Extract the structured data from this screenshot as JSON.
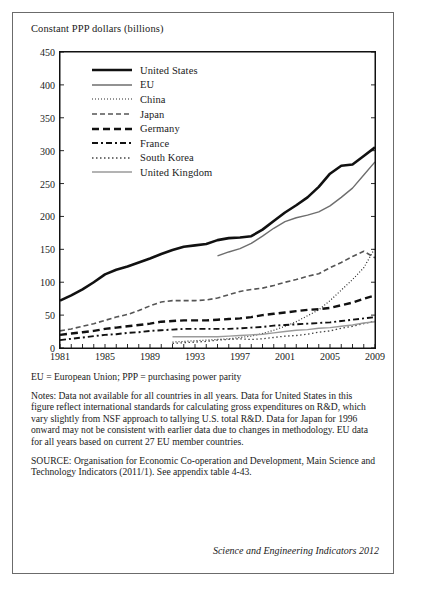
{
  "figure": {
    "axis_title": "Constant PPP dollars (billions)",
    "abbrev_note": "EU = European Union;  PPP = purchasing power parity",
    "notes": "Notes: Data not available for all countries in all years. Data for United States in this figure reflect international standards for calculating gross expenditures on R&D, which vary slightly from NSF approach to tallying U.S. total R&D. Data for Japan for 1996 onward may not be consistent with earlier data due to changes in methodology. EU data for all years based on current 27 EU member countries.",
    "source": "SOURCE: Organisation for Economic Co-operation and Development, Main Science and Technology Indicators (2011/1). See appendix table 4-43.",
    "credit": "Science and Engineering Indicators 2012"
  },
  "chart_data": {
    "type": "line",
    "title": "",
    "xlabel": "",
    "ylabel": "Constant PPP dollars (billions)",
    "xlim": [
      1981,
      2009
    ],
    "ylim": [
      0,
      450
    ],
    "ytick_values": [
      0,
      50,
      100,
      150,
      200,
      250,
      300,
      350,
      400,
      450
    ],
    "xtick_values": [
      1981,
      1985,
      1989,
      1993,
      1997,
      2001,
      2005,
      2009
    ],
    "xtick_labels": [
      "1981",
      "1985",
      "1989",
      "1993",
      "1997",
      "2001",
      "2005",
      "2009"
    ],
    "grid": false,
    "legend_position": "upper-left-inside",
    "series": [
      {
        "name": "United States",
        "color": "#111111",
        "width": 2.6,
        "dash": "none",
        "x": [
          1981,
          1982,
          1983,
          1984,
          1985,
          1986,
          1987,
          1988,
          1989,
          1990,
          1991,
          1992,
          1993,
          1994,
          1995,
          1996,
          1997,
          1998,
          1999,
          2000,
          2001,
          2002,
          2003,
          2004,
          2005,
          2006,
          2007,
          2008,
          2009
        ],
        "y": [
          72,
          80,
          89,
          100,
          112,
          119,
          124,
          130,
          136,
          143,
          149,
          154,
          156,
          158,
          164,
          167,
          168,
          170,
          180,
          193,
          206,
          217,
          229,
          245,
          265,
          277,
          279,
          292,
          305
        ]
      },
      {
        "name": "EU",
        "color": "#6e6e6e",
        "width": 1.4,
        "dash": "none",
        "x": [
          1995,
          1996,
          1997,
          1998,
          1999,
          2000,
          2001,
          2002,
          2003,
          2004,
          2005,
          2006,
          2007,
          2008,
          2009
        ],
        "y": [
          140,
          146,
          151,
          159,
          170,
          182,
          192,
          198,
          202,
          207,
          216,
          229,
          243,
          263,
          283
        ]
      },
      {
        "name": "China",
        "color": "#2b2b2b",
        "width": 1.2,
        "dash": "1,2",
        "x": [
          1991,
          1992,
          1993,
          1994,
          1995,
          1996,
          1997,
          1998,
          1999,
          2000,
          2001,
          2002,
          2003,
          2004,
          2005,
          2006,
          2007,
          2008,
          2009
        ],
        "y": [
          9,
          10,
          11,
          12,
          13,
          14,
          16,
          18,
          22,
          27,
          33,
          40,
          49,
          58,
          72,
          88,
          104,
          122,
          152
        ]
      },
      {
        "name": "Japan",
        "color": "#555555",
        "width": 1.6,
        "dash": "5,3",
        "x": [
          1981,
          1982,
          1983,
          1984,
          1985,
          1986,
          1987,
          1988,
          1989,
          1990,
          1991,
          1992,
          1993,
          1994,
          1995,
          1996,
          1997,
          1998,
          1999,
          2000,
          2001,
          2002,
          2003,
          2004,
          2005,
          2006,
          2007,
          2008,
          2009
        ],
        "y": [
          26,
          29,
          33,
          37,
          42,
          47,
          51,
          57,
          64,
          70,
          72,
          72,
          72,
          73,
          76,
          81,
          86,
          89,
          91,
          95,
          100,
          104,
          109,
          113,
          122,
          130,
          139,
          147,
          137
        ]
      },
      {
        "name": "Germany",
        "color": "#111111",
        "width": 2.4,
        "dash": "7,4",
        "x": [
          1981,
          1982,
          1983,
          1984,
          1985,
          1986,
          1987,
          1988,
          1989,
          1990,
          1991,
          1992,
          1993,
          1994,
          1995,
          1996,
          1997,
          1998,
          1999,
          2000,
          2001,
          2002,
          2003,
          2004,
          2005,
          2006,
          2007,
          2008,
          2009
        ],
        "y": [
          20,
          22,
          24,
          26,
          29,
          31,
          33,
          35,
          37,
          40,
          41,
          42,
          42,
          42,
          43,
          44,
          45,
          47,
          50,
          52,
          54,
          56,
          58,
          59,
          61,
          65,
          69,
          75,
          80
        ]
      },
      {
        "name": "France",
        "color": "#111111",
        "width": 1.9,
        "dash": "6,3,2,3",
        "x": [
          1981,
          1982,
          1983,
          1984,
          1985,
          1986,
          1987,
          1988,
          1989,
          1990,
          1991,
          1992,
          1993,
          1994,
          1995,
          1996,
          1997,
          1998,
          1999,
          2000,
          2001,
          2002,
          2003,
          2004,
          2005,
          2006,
          2007,
          2008,
          2009
        ],
        "y": [
          12,
          14,
          16,
          18,
          20,
          21,
          23,
          24,
          26,
          27,
          28,
          29,
          29,
          29,
          29,
          29,
          30,
          31,
          32,
          34,
          35,
          36,
          37,
          38,
          39,
          41,
          43,
          45,
          47
        ]
      },
      {
        "name": "South Korea",
        "color": "#444444",
        "width": 1.3,
        "dash": "1.5,2.5",
        "x": [
          1991,
          1992,
          1993,
          1994,
          1995,
          1996,
          1997,
          1998,
          1999,
          2000,
          2001,
          2002,
          2003,
          2004,
          2005,
          2006,
          2007,
          2008,
          2009
        ],
        "y": [
          7,
          8,
          9,
          10,
          12,
          13,
          14,
          13,
          14,
          16,
          18,
          19,
          21,
          24,
          26,
          30,
          33,
          37,
          41
        ]
      },
      {
        "name": "United Kingdom",
        "color": "#9a9a9a",
        "width": 1.4,
        "dash": "none",
        "x": [
          1991,
          1992,
          1993,
          1994,
          1995,
          1996,
          1997,
          1998,
          1999,
          2000,
          2001,
          2002,
          2003,
          2004,
          2005,
          2006,
          2007,
          2008,
          2009
        ],
        "y": [
          17,
          17,
          17,
          17,
          17,
          18,
          19,
          20,
          21,
          23,
          25,
          27,
          28,
          30,
          31,
          33,
          35,
          38,
          40
        ]
      }
    ]
  }
}
